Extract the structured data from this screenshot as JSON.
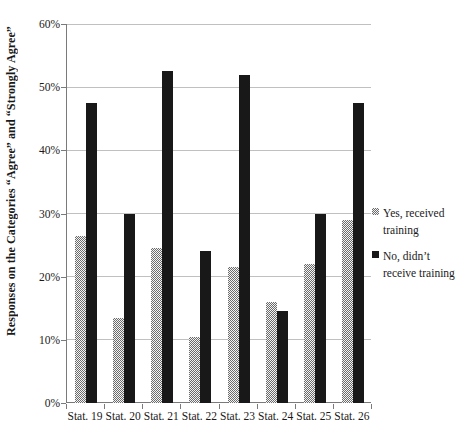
{
  "chart_data": {
    "type": "bar",
    "title": "",
    "categories": [
      "Stat. 19",
      "Stat. 20",
      "Stat. 21",
      "Stat. 22",
      "Stat. 23",
      "Stat. 24",
      "Stat. 25",
      "Stat. 26"
    ],
    "series": [
      {
        "name": "Yes, received training",
        "values": [
          26.5,
          13.5,
          24.5,
          10.5,
          21.5,
          16,
          22,
          29
        ],
        "fill": "dotted-gray",
        "color": "#a8a8a8"
      },
      {
        "name": "No, didn’t receive training",
        "values": [
          47.5,
          30,
          52.5,
          24,
          52,
          14.5,
          30,
          47.5
        ],
        "fill": "solid",
        "color": "#181818"
      }
    ],
    "ylabel": "Responses on the Categories “Agree” and “Strongly Agree”",
    "xlabel": "",
    "ylim": [
      0,
      60
    ],
    "ytick_step": 10,
    "yticks": [
      "0%",
      "10%",
      "20%",
      "30%",
      "40%",
      "50%",
      "60%"
    ],
    "grid": true,
    "legend_position": "right",
    "colors": {
      "grid": "#c0c0c0",
      "axis": "#7a7a7a",
      "background": "#ffffff",
      "bar_no": "#181818",
      "bar_yes_dot": "#6b6b6b"
    }
  }
}
